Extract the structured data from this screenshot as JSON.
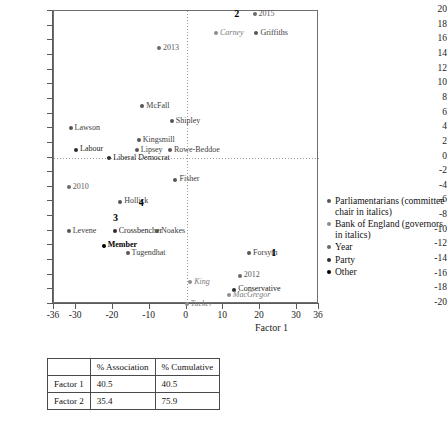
{
  "chart_data": {
    "type": "scatter",
    "title": "",
    "xlabel": "Factor 1",
    "ylabel": "Factor 2",
    "xlim": [
      -36,
      36
    ],
    "ylim": [
      -20,
      20
    ],
    "xticks": [
      -36,
      -30,
      -20,
      -10,
      0,
      10,
      20,
      30,
      36
    ],
    "xticklabels": [
      "-36",
      "-30",
      "-20",
      "-10",
      "0",
      "10",
      "20",
      "30",
      "36"
    ],
    "yticks": [
      20,
      18,
      16,
      14,
      12,
      10,
      8,
      6,
      4,
      2,
      0,
      -2,
      -4,
      -6,
      -8,
      -10,
      -12,
      -14,
      -16,
      -18,
      -20
    ],
    "yticklabels": [
      "20",
      "18",
      "16",
      "14",
      "12",
      "10",
      "8",
      "6",
      "4",
      "2",
      "0",
      "-2",
      "-4",
      "-6",
      "-8",
      "-10",
      "-12",
      "-14",
      "-16",
      "-18",
      "-20"
    ],
    "grid": false,
    "reference_lines": {
      "x": 0,
      "y": 0,
      "style": "dotted"
    },
    "legend_position": "right",
    "points": [
      {
        "label": "2015",
        "x": 18.5,
        "y": 19.6,
        "category": "year"
      },
      {
        "label": "Carney",
        "x": 8.0,
        "y": 17.0,
        "category": "bank-of-england"
      },
      {
        "label": "Griffiths",
        "x": 19.0,
        "y": 17.0,
        "category": "parliamentarians"
      },
      {
        "label": "2013",
        "x": -7.5,
        "y": 15.0,
        "category": "year"
      },
      {
        "label": "McFall",
        "x": -12.0,
        "y": 7.0,
        "category": "parliamentarians"
      },
      {
        "label": "Shipley",
        "x": -4.0,
        "y": 5.0,
        "category": "parliamentarians"
      },
      {
        "label": "Lawson",
        "x": -31.5,
        "y": 4.0,
        "category": "parliamentarians"
      },
      {
        "label": "Kingsmill",
        "x": -13.0,
        "y": 2.4,
        "category": "parliamentarians"
      },
      {
        "label": "Labour",
        "x": -30.0,
        "y": 1.1,
        "category": "party"
      },
      {
        "label": "Lipsey",
        "x": -13.5,
        "y": 1.0,
        "category": "parliamentarians"
      },
      {
        "label": "Rowe-Beddoe",
        "x": -4.5,
        "y": 1.0,
        "category": "parliamentarians"
      },
      {
        "label": "Liberal Democrat",
        "x": -21.0,
        "y": 0.0,
        "category": "party"
      },
      {
        "label": "Fisher",
        "x": -3.0,
        "y": -3.0,
        "category": "parliamentarians"
      },
      {
        "label": "2010",
        "x": -32.0,
        "y": -4.0,
        "category": "year"
      },
      {
        "label": "Hollick",
        "x": -18.0,
        "y": -6.0,
        "category": "parliamentarians"
      },
      {
        "label": "Levene",
        "x": -32.0,
        "y": -10.0,
        "category": "parliamentarians"
      },
      {
        "label": "Crossbencher",
        "x": -19.5,
        "y": -10.0,
        "category": "party"
      },
      {
        "label": "Noakes",
        "x": -8.0,
        "y": -10.0,
        "category": "parliamentarians"
      },
      {
        "label": "Member",
        "x": -22.5,
        "y": -12.0,
        "category": "other"
      },
      {
        "label": "Tugendhat",
        "x": -16.0,
        "y": -13.0,
        "category": "parliamentarians"
      },
      {
        "label": "Forsyth",
        "x": 17.0,
        "y": -13.0,
        "category": "parliamentarians"
      },
      {
        "label": "King",
        "x": 1.0,
        "y": -17.0,
        "category": "bank-of-england"
      },
      {
        "label": "2012",
        "x": 14.5,
        "y": -16.1,
        "category": "year"
      },
      {
        "label": "Conservative",
        "x": 13.0,
        "y": -18.0,
        "category": "party"
      },
      {
        "label": "MacGregor",
        "x": 11.5,
        "y": -18.8,
        "category": "bank-of-england"
      },
      {
        "label": "Tucker",
        "x": 0.0,
        "y": -20.0,
        "category": "bank-of-england"
      }
    ],
    "quadrant_numbers": [
      {
        "label": "2",
        "x": 13.0,
        "y": 19.6
      },
      {
        "label": "4",
        "x": -13.0,
        "y": -6.2
      },
      {
        "label": "3",
        "x": -20.0,
        "y": -8.2
      },
      {
        "label": "1",
        "x": 23.0,
        "y": -13.0
      }
    ],
    "legend": [
      {
        "key": "parliamentarians",
        "label": "Parliamentarians (committee chair in italics)",
        "color": "#565656"
      },
      {
        "key": "bank-of-england",
        "label": "Bank of England (governors in italics)",
        "color": "#8d8d8d"
      },
      {
        "key": "year",
        "label": "Year",
        "color": "#6a6a6a"
      },
      {
        "key": "party",
        "label": "Party",
        "color": "#2e2e2e"
      },
      {
        "key": "other",
        "label": "Other",
        "color": "#000000"
      }
    ],
    "table": {
      "corner": "",
      "columns": [
        "% Association",
        "% Cumulative"
      ],
      "rows": [
        {
          "name": "Factor 1",
          "values": [
            "40.5",
            "40.5"
          ]
        },
        {
          "name": "Factor 2",
          "values": [
            "35.4",
            "75.9"
          ]
        }
      ]
    }
  }
}
